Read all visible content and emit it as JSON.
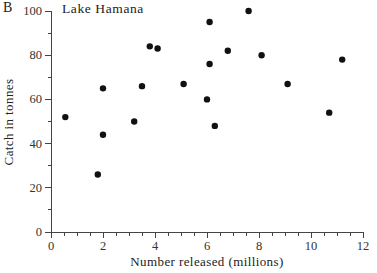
{
  "chart_data": {
    "type": "scatter",
    "panel_label": "B",
    "title": "Lake Hamana",
    "xlabel": "Number released (millions)",
    "ylabel": "Catch in tonnes",
    "xlim": [
      0,
      12
    ],
    "ylim": [
      0,
      100
    ],
    "x_major_ticks": [
      0,
      2,
      4,
      6,
      8,
      10,
      12
    ],
    "x_minor_tick_step": 0.5,
    "y_major_ticks": [
      0,
      20,
      40,
      60,
      80,
      100
    ],
    "y_minor_ticks": [
      10,
      30,
      50,
      70,
      90
    ],
    "grid": false,
    "legend": false,
    "marker": {
      "shape": "circle",
      "color": "#111111",
      "radius_px": 3.2
    },
    "axis_color": "#444444",
    "text_color": "#333333",
    "background": "#ffffff",
    "points": [
      {
        "x": 0.55,
        "y": 52
      },
      {
        "x": 1.8,
        "y": 26
      },
      {
        "x": 2.0,
        "y": 44
      },
      {
        "x": 2.0,
        "y": 65
      },
      {
        "x": 3.2,
        "y": 50
      },
      {
        "x": 3.5,
        "y": 66
      },
      {
        "x": 3.8,
        "y": 84
      },
      {
        "x": 4.1,
        "y": 83
      },
      {
        "x": 5.1,
        "y": 67
      },
      {
        "x": 6.0,
        "y": 60
      },
      {
        "x": 6.1,
        "y": 76
      },
      {
        "x": 6.1,
        "y": 95
      },
      {
        "x": 6.3,
        "y": 48
      },
      {
        "x": 6.8,
        "y": 82
      },
      {
        "x": 7.6,
        "y": 100
      },
      {
        "x": 8.1,
        "y": 80
      },
      {
        "x": 9.1,
        "y": 67
      },
      {
        "x": 10.7,
        "y": 54
      },
      {
        "x": 11.2,
        "y": 78
      }
    ]
  }
}
